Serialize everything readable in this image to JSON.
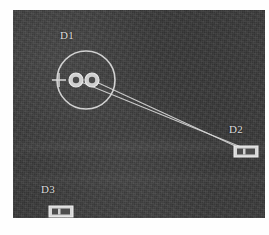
{
  "figure": {
    "panel": {
      "background_color": "#3b3b3b",
      "stroke_color": "#d8d8d8",
      "width": 252,
      "height": 208
    },
    "caption": ""
  },
  "markers": [
    {
      "id": "D1",
      "label": "D1",
      "type": "circle-assembly",
      "center_x": 73,
      "center_y": 70,
      "radius": 29,
      "crosshair_x": 46,
      "crosshair_y": 70,
      "inner_discs": [
        {
          "cx": 63,
          "cy": 70,
          "r": 7
        },
        {
          "cx": 79,
          "cy": 70,
          "r": 7
        }
      ]
    },
    {
      "id": "D2",
      "label": "D2",
      "type": "rect-marker",
      "x": 221,
      "y": 136,
      "width": 24,
      "height": 11
    },
    {
      "id": "D3",
      "label": "D3",
      "type": "rect-marker",
      "x": 36,
      "y": 196,
      "width": 24,
      "height": 11
    }
  ],
  "connections": [
    {
      "from": "D1-disc-left",
      "to": "D2",
      "x1": 63,
      "y1": 70,
      "x2": 233,
      "y2": 139
    },
    {
      "from": "D1-disc-right",
      "to": "D2",
      "x1": 79,
      "y1": 70,
      "x2": 233,
      "y2": 141
    }
  ]
}
